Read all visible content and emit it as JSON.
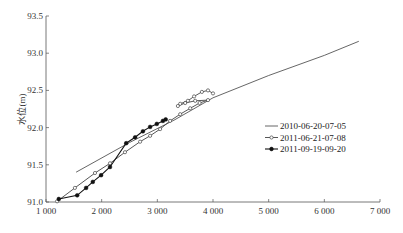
{
  "chart_data": {
    "type": "line",
    "title": "",
    "xlabel": "",
    "ylabel": "水位(m)",
    "xlim": [
      1000,
      7000
    ],
    "ylim": [
      91.0,
      93.5
    ],
    "x_ticks": [
      1000,
      2000,
      3000,
      4000,
      5000,
      6000,
      7000
    ],
    "x_tick_labels": [
      "1 000",
      "2 000",
      "3 000",
      "4 000",
      "5 000",
      "6 000",
      "7 000"
    ],
    "y_ticks": [
      91.0,
      91.5,
      92.0,
      92.5,
      93.0,
      93.5
    ],
    "y_tick_labels": [
      "91.0",
      "91.5",
      "92.0",
      "92.5",
      "93.0",
      "93.5"
    ],
    "grid": false,
    "legend_position": "lower right",
    "series": [
      {
        "name": "2010-06-20-07-05",
        "marker": "none",
        "color": "#555555",
        "x": [
          1540,
          2500,
          3300,
          4000,
          5000,
          6000,
          6620
        ],
        "y": [
          91.4,
          91.8,
          92.1,
          92.4,
          92.7,
          92.97,
          93.16
        ]
      },
      {
        "name": "2011-06-21-07-08",
        "marker": "open-circle",
        "color": "#444444",
        "x": [
          1200,
          1520,
          1880,
          2150,
          2420,
          2690,
          2870,
          3050,
          3230,
          3410,
          3590,
          3760,
          3910,
          3680,
          3500,
          3370,
          3410,
          3550,
          3660,
          3800,
          3910,
          4000
        ],
        "y": [
          91.01,
          91.19,
          91.39,
          91.52,
          91.67,
          91.81,
          91.89,
          91.98,
          92.09,
          92.18,
          92.26,
          92.33,
          92.37,
          92.36,
          92.33,
          92.29,
          92.32,
          92.36,
          92.42,
          92.48,
          92.5,
          92.46
        ]
      },
      {
        "name": "2011-09-19-09-20",
        "marker": "filled-circle",
        "color": "#111111",
        "x": [
          1230,
          1560,
          1720,
          1840,
          1990,
          2150,
          2440,
          2600,
          2740,
          2870,
          2990,
          3100,
          3150
        ],
        "y": [
          91.04,
          91.09,
          91.19,
          91.27,
          91.36,
          91.47,
          91.79,
          91.87,
          91.95,
          92.01,
          92.05,
          92.09,
          92.11
        ]
      }
    ]
  },
  "legend": {
    "items": [
      {
        "label": "2010-06-20-07-05"
      },
      {
        "label": "2011-06-21-07-08"
      },
      {
        "label": "2011-09-19-09-20"
      }
    ]
  }
}
